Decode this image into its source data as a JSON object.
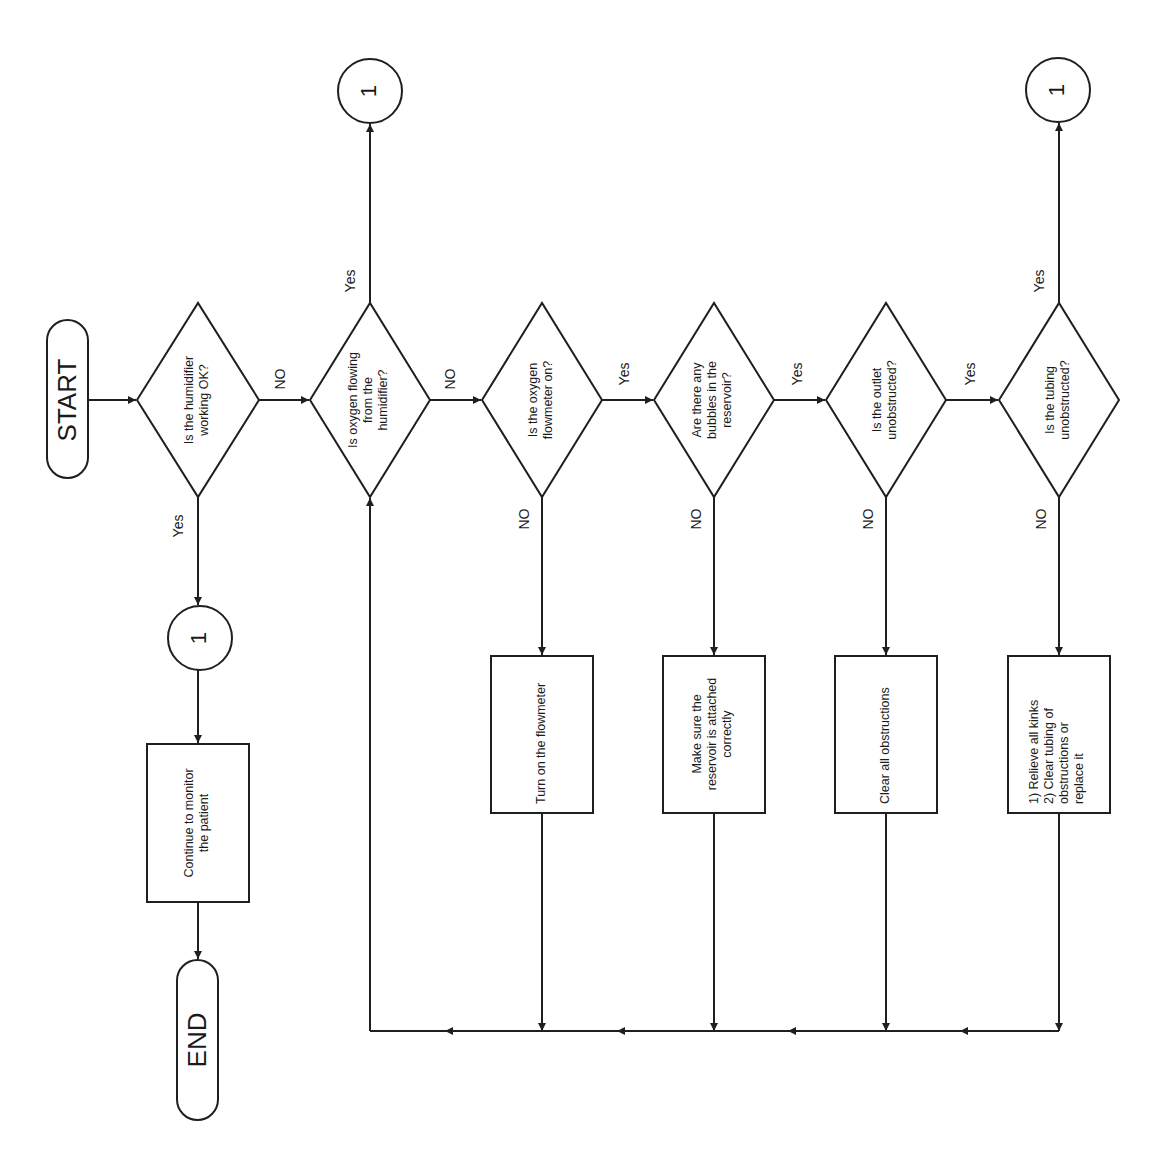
{
  "diagram": {
    "orientation": "rotated 90 degrees counter-clockwise",
    "colors": {
      "stroke": "#1f1f1f",
      "fill": "#ffffff",
      "text": "#1a1a1a"
    },
    "terminals": {
      "start": {
        "label": "START"
      },
      "end": {
        "label": "END"
      }
    },
    "decisions": [
      {
        "id": "d1",
        "lines": [
          "Is the humidifier",
          "working OK?"
        ],
        "yes_label": "Yes",
        "no_label": "NO"
      },
      {
        "id": "d2",
        "lines": [
          "Is oxygen flowing",
          "from the",
          "humidifier?"
        ],
        "yes_label": "Yes",
        "no_label": "NO"
      },
      {
        "id": "d3",
        "lines": [
          "Is the oxygen",
          "flowmeter on?"
        ],
        "yes_label": "Yes",
        "no_label": "NO"
      },
      {
        "id": "d4",
        "lines": [
          "Are there any",
          "bubbles in the",
          "reservoir?"
        ],
        "yes_label": "Yes",
        "no_label": "NO"
      },
      {
        "id": "d5",
        "lines": [
          "Is the outlet",
          "unobstructed?"
        ],
        "yes_label": "Yes",
        "no_label": "NO"
      },
      {
        "id": "d6",
        "lines": [
          "Is the tubing",
          "unobstructed?"
        ],
        "yes_label": "Yes",
        "no_label": "NO"
      }
    ],
    "processes": [
      {
        "id": "p_monitor",
        "lines": [
          "Continue to monitor",
          "the patient"
        ]
      },
      {
        "id": "p3",
        "lines": [
          "Turn on the flowmeter"
        ]
      },
      {
        "id": "p4",
        "lines": [
          "Make sure the",
          "reservoir is attached",
          "correctly"
        ]
      },
      {
        "id": "p5",
        "lines": [
          "Clear all obstructions"
        ]
      },
      {
        "id": "p6",
        "lines": [
          "1) Relieve all kinks",
          "2) Clear tubing of",
          "obstructions or",
          "replace it"
        ]
      }
    ],
    "connectors": [
      {
        "id": "c_in",
        "label": "1"
      },
      {
        "id": "c_out_a",
        "label": "1"
      },
      {
        "id": "c_out_b",
        "label": "1"
      }
    ]
  }
}
